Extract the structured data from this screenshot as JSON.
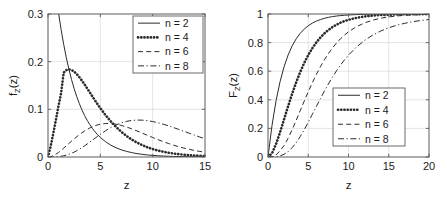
{
  "figure": {
    "panels": [
      "pdf",
      "cdf"
    ]
  },
  "chart_data": [
    {
      "type": "line",
      "title": "",
      "xlabel": "z",
      "ylabel": "f_Z(z)",
      "ylabel_main": "f",
      "ylabel_sub": "Z",
      "ylabel_tail": "(z)",
      "xlim": [
        0,
        15
      ],
      "ylim": [
        0,
        0.3
      ],
      "xticks": [
        0,
        5,
        10,
        15
      ],
      "xtick_labels": [
        "0",
        "5",
        "10",
        "15"
      ],
      "yticks": [
        0,
        0.1,
        0.2,
        0.3
      ],
      "ytick_labels": [
        "0",
        "0.1",
        "0.2",
        "0.3"
      ],
      "grid": true,
      "legend_position": "top-right",
      "legend": [
        "n = 2",
        "n = 4",
        "n = 6",
        "n = 8"
      ],
      "x": [
        0,
        0.25,
        0.5,
        0.75,
        1,
        1.25,
        1.5,
        1.75,
        2,
        2.25,
        2.5,
        2.75,
        3,
        3.25,
        3.5,
        3.75,
        4,
        4.25,
        4.5,
        4.75,
        5,
        5.5,
        6,
        6.5,
        7,
        7.5,
        8,
        8.5,
        9,
        9.5,
        10,
        10.5,
        11,
        11.5,
        12,
        12.5,
        13,
        13.5,
        14,
        14.5,
        15
      ],
      "series": [
        {
          "name": "n = 2",
          "style": "solid",
          "values": [
            0.5,
            0.4412,
            0.3894,
            0.3436,
            0.3033,
            0.2676,
            0.2362,
            0.2084,
            0.1839,
            0.1623,
            0.1433,
            0.1264,
            0.1116,
            0.0985,
            0.0869,
            0.0767,
            0.0677,
            0.0597,
            0.0527,
            0.0465,
            0.041,
            0.032,
            0.0249,
            0.0194,
            0.0151,
            0.0118,
            0.0092,
            0.0071,
            0.0056,
            0.0043,
            0.0034,
            0.0026,
            0.002,
            0.0016,
            0.0012,
            0.001,
            0.0008,
            0.0006,
            0.0005,
            0.0004,
            0.0003
          ]
        },
        {
          "name": "n = 4",
          "style": "dotted",
          "values": [
            0,
            0.0221,
            0.0487,
            0.0773,
            0.1066,
            0.1338,
            0.1771,
            0.1823,
            0.1839,
            0.1826,
            0.1791,
            0.1738,
            0.1674,
            0.16,
            0.1521,
            0.1438,
            0.1353,
            0.1268,
            0.1185,
            0.1103,
            0.1025,
            0.0879,
            0.0747,
            0.0631,
            0.0529,
            0.0442,
            0.0366,
            0.0302,
            0.0249,
            0.0204,
            0.0167,
            0.0136,
            0.0111,
            0.009,
            0.0073,
            0.0059,
            0.0047,
            0.0038,
            0.0031,
            0.0025,
            0.002
          ]
        },
        {
          "name": "n = 6",
          "style": "dashed",
          "values": [
            0,
            0.0007,
            0.0027,
            0.0057,
            0.0095,
            0.0139,
            0.0186,
            0.0235,
            0.0284,
            0.0333,
            0.038,
            0.0426,
            0.0469,
            0.0509,
            0.0546,
            0.0579,
            0.0609,
            0.0634,
            0.0656,
            0.0674,
            0.0688,
            0.0703,
            0.0702,
            0.0688,
            0.0663,
            0.063,
            0.0591,
            0.0547,
            0.0501,
            0.0455,
            0.0409,
            0.0365,
            0.0323,
            0.0284,
            0.0248,
            0.0215,
            0.0186,
            0.016,
            0.0137,
            0.0117,
            0.0099
          ]
        },
        {
          "name": "n = 8",
          "style": "dashdot",
          "values": [
            0,
            0,
            0.0001,
            0.0004,
            0.0008,
            0.0015,
            0.0026,
            0.0039,
            0.0057,
            0.0078,
            0.0103,
            0.0131,
            0.0163,
            0.0198,
            0.0235,
            0.0274,
            0.0314,
            0.0354,
            0.0395,
            0.0436,
            0.0476,
            0.0551,
            0.0617,
            0.0672,
            0.0716,
            0.0747,
            0.0767,
            0.0775,
            0.0773,
            0.0762,
            0.0744,
            0.0719,
            0.0688,
            0.0654,
            0.0617,
            0.0578,
            0.0538,
            0.0498,
            0.0458,
            0.0419,
            0.0382
          ]
        }
      ],
      "note": "Chi-square probability density functions, degrees of freedom n"
    },
    {
      "type": "line",
      "title": "",
      "xlabel": "z",
      "ylabel": "F_Z(z)",
      "ylabel_main": "F",
      "ylabel_sub": "Z",
      "ylabel_tail": "(z)",
      "xlim": [
        0,
        20
      ],
      "ylim": [
        0,
        1
      ],
      "xticks": [
        0,
        5,
        10,
        15,
        20
      ],
      "xtick_labels": [
        "0",
        "5",
        "10",
        "15",
        "20"
      ],
      "yticks": [
        0,
        0.2,
        0.4,
        0.6,
        0.8,
        1
      ],
      "ytick_labels": [
        "0",
        "0.2",
        "0.4",
        "0.6",
        "0.8",
        "1"
      ],
      "grid": true,
      "legend_position": "center-right",
      "legend": [
        "n = 2",
        "n = 4",
        "n = 6",
        "n = 8"
      ],
      "x": [
        0,
        0.5,
        1,
        1.5,
        2,
        2.5,
        3,
        3.5,
        4,
        4.5,
        5,
        5.5,
        6,
        6.5,
        7,
        7.5,
        8,
        8.5,
        9,
        9.5,
        10,
        11,
        12,
        13,
        14,
        15,
        16,
        17,
        18,
        19,
        20
      ],
      "series": [
        {
          "name": "n = 2",
          "style": "solid",
          "values": [
            0,
            0.2212,
            0.3935,
            0.5276,
            0.6321,
            0.7135,
            0.7769,
            0.8262,
            0.8647,
            0.8946,
            0.9179,
            0.9361,
            0.9502,
            0.9612,
            0.9698,
            0.9765,
            0.9817,
            0.9857,
            0.9889,
            0.9913,
            0.9933,
            0.9959,
            0.9975,
            0.9985,
            0.9991,
            0.9994,
            0.9997,
            0.9998,
            0.9999,
            0.9999,
            1
          ]
        },
        {
          "name": "n = 4",
          "style": "dotted",
          "values": [
            0,
            0.0265,
            0.0902,
            0.1734,
            0.2642,
            0.3554,
            0.4422,
            0.5221,
            0.594,
            0.6575,
            0.7127,
            0.7601,
            0.8009,
            0.8352,
            0.8641,
            0.8883,
            0.9084,
            0.925,
            0.9389,
            0.9502,
            0.9596,
            0.9734,
            0.9826,
            0.9887,
            0.9927,
            0.9953,
            0.997,
            0.9981,
            0.9988,
            0.9992,
            0.9995
          ]
        },
        {
          "name": "n = 6",
          "style": "dashed",
          "values": [
            0,
            0.0018,
            0.0144,
            0.0439,
            0.0803,
            0.1315,
            0.1912,
            0.256,
            0.3233,
            0.3907,
            0.4562,
            0.5188,
            0.5768,
            0.6304,
            0.6792,
            0.7229,
            0.7619,
            0.7963,
            0.8264,
            0.8527,
            0.8753,
            0.9115,
            0.938,
            0.957,
            0.9704,
            0.9797,
            0.9862,
            0.9906,
            0.9936,
            0.9957,
            0.9972
          ]
        },
        {
          "name": "n = 8",
          "style": "dashdot",
          "values": [
            0,
            0.0001,
            0.0018,
            0.0076,
            0.019,
            0.0374,
            0.0656,
            0.0996,
            0.1429,
            0.1912,
            0.2424,
            0.2983,
            0.3528,
            0.4072,
            0.4603,
            0.5108,
            0.558,
            0.6018,
            0.6425,
            0.6791,
            0.7127,
            0.7693,
            0.8153,
            0.852,
            0.881,
            0.9037,
            0.9214,
            0.9352,
            0.9462,
            0.9549,
            0.9617
          ]
        }
      ],
      "note": "Chi-square cumulative distribution functions, degrees of freedom n"
    }
  ],
  "colors": {
    "axis": "#5a5a5a",
    "grid": "#d8d8e0",
    "curve": "#2b2b2b",
    "background": "#ffffff"
  }
}
